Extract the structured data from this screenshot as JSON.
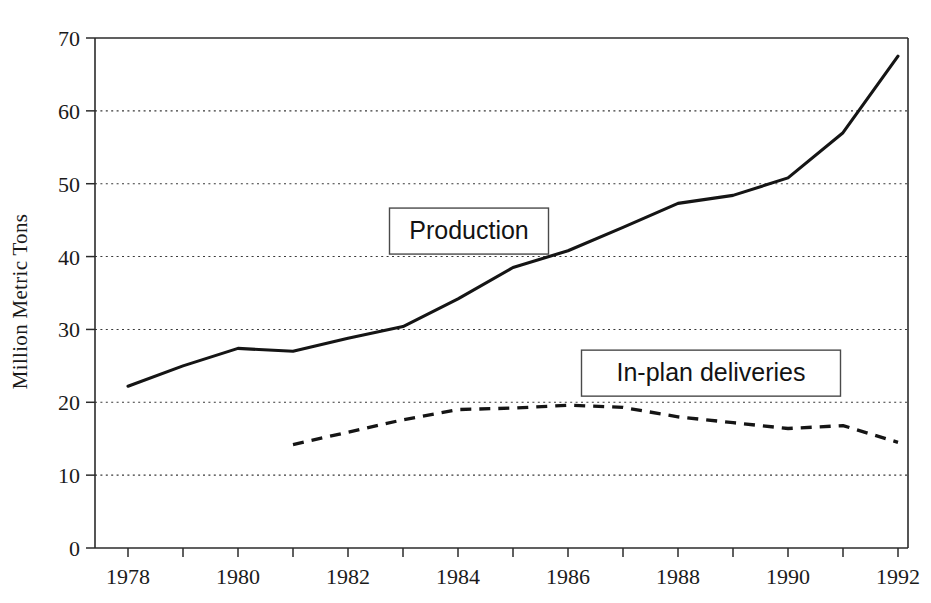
{
  "chart_data": {
    "type": "line",
    "title": "",
    "xlabel": "",
    "ylabel": "Million Metric Tons",
    "xlim": [
      1977.4,
      1992.6
    ],
    "ylim": [
      0,
      70
    ],
    "grid": true,
    "grid_axis": "y",
    "legend_position": "inline-callouts",
    "y_ticks": [
      0,
      10,
      20,
      30,
      40,
      50,
      60,
      70
    ],
    "y_tick_labels": [
      "0",
      "10",
      "20",
      "30",
      "40",
      "50",
      "60",
      "70"
    ],
    "x_ticks": [
      1978,
      1979,
      1980,
      1981,
      1982,
      1983,
      1984,
      1985,
      1986,
      1987,
      1988,
      1989,
      1990,
      1991,
      1992
    ],
    "x_tick_labels": [
      "1978",
      "",
      "1980",
      "",
      "1982",
      "",
      "1984",
      "",
      "1986",
      "",
      "1988",
      "",
      "1990",
      "",
      "1992"
    ],
    "series": [
      {
        "name": "Production",
        "style": "solid",
        "x": [
          1978,
          1979,
          1980,
          1981,
          1982,
          1983,
          1984,
          1985,
          1986,
          1987,
          1988,
          1989,
          1990,
          1991,
          1992
        ],
        "values": [
          22.2,
          25.0,
          27.4,
          27.0,
          28.8,
          30.4,
          34.2,
          38.5,
          40.8,
          44.0,
          47.3,
          48.4,
          50.8,
          57.0,
          67.5
        ]
      },
      {
        "name": "In-plan deliveries",
        "style": "dashed",
        "x": [
          1981,
          1982,
          1983,
          1984,
          1985,
          1986,
          1987,
          1988,
          1989,
          1990,
          1991,
          1992
        ],
        "values": [
          14.2,
          15.9,
          17.6,
          19.0,
          19.2,
          19.6,
          19.3,
          18.0,
          17.2,
          16.4,
          16.8,
          14.5
        ]
      }
    ],
    "annotations": [
      {
        "label": "Production",
        "x": 1984.2,
        "y": 43.5
      },
      {
        "label": "In-plan deliveries",
        "x": 1988.6,
        "y": 24.0
      }
    ]
  },
  "axes": {
    "y_axis_title": "Million Metric Tons"
  }
}
